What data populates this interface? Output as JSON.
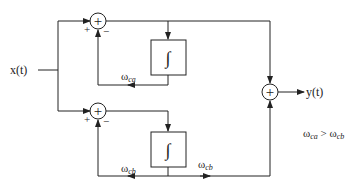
{
  "diagram": {
    "input_label": "x(t)",
    "output_label": "y(t)",
    "sum_symbol": "+",
    "integrator_symbol": "∫",
    "top_branch": {
      "plus_sign": "+",
      "minus_sign": "−",
      "feedback_label_main": "ω",
      "feedback_label_sub": "ca"
    },
    "bottom_branch": {
      "plus_sign": "+",
      "minus_sign": "−",
      "feedback_label_main": "ω",
      "feedback_label_sub": "cb",
      "output_label_main": "ω",
      "output_label_sub": "cb"
    },
    "condition": {
      "left_main": "ω",
      "left_sub": "ca",
      "op": " > ",
      "right_main": "ω",
      "right_sub": "cb"
    },
    "colors": {
      "line": "#222222",
      "background": "#ffffff"
    }
  }
}
